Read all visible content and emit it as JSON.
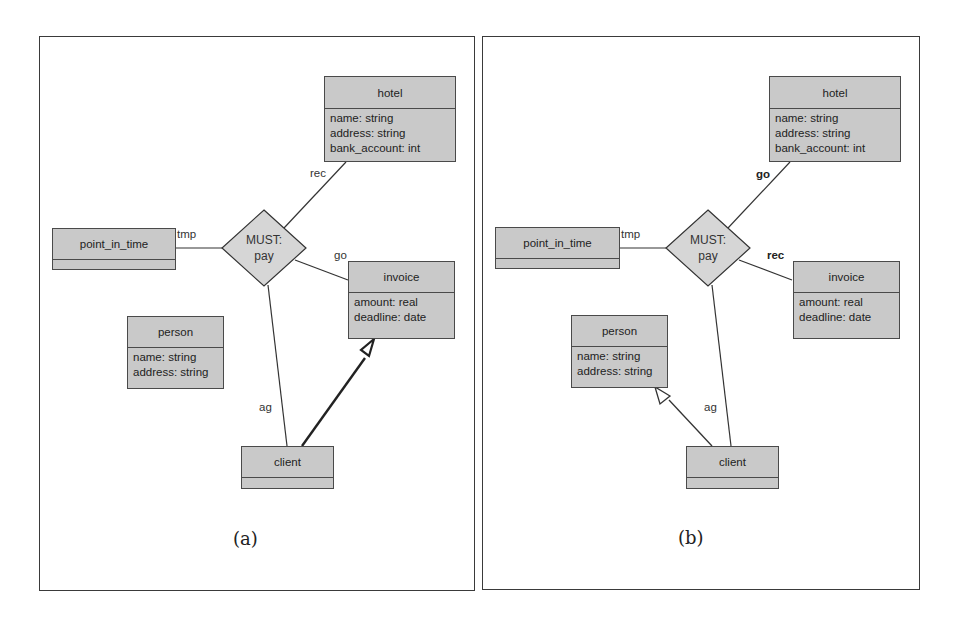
{
  "panels": [
    {
      "id": "a",
      "caption": "(a)",
      "relationship": {
        "line1": "MUST:",
        "line2": "pay"
      },
      "classes": {
        "hotel": {
          "name": "hotel",
          "attrs": [
            "name: string",
            "address: string",
            "bank_account: int"
          ]
        },
        "point_in_time": {
          "name": "point_in_time",
          "attrs": []
        },
        "invoice": {
          "name": "invoice",
          "attrs": [
            "amount: real",
            "deadline: date"
          ]
        },
        "person": {
          "name": "person",
          "attrs": [
            "name: string",
            "address: string"
          ]
        },
        "client": {
          "name": "client",
          "attrs": []
        }
      },
      "roles": {
        "hotel": "rec",
        "point_in_time": "tmp",
        "invoice": "go",
        "client": "ag"
      },
      "generalization": {
        "from": "client",
        "to": "invoice",
        "style": "thick"
      }
    },
    {
      "id": "b",
      "caption": "(b)",
      "relationship": {
        "line1": "MUST:",
        "line2": "pay"
      },
      "classes": {
        "hotel": {
          "name": "hotel",
          "attrs": [
            "name: string",
            "address: string",
            "bank_account: int"
          ]
        },
        "point_in_time": {
          "name": "point_in_time",
          "attrs": []
        },
        "invoice": {
          "name": "invoice",
          "attrs": [
            "amount: real",
            "deadline: date"
          ]
        },
        "person": {
          "name": "person",
          "attrs": [
            "name: string",
            "address: string"
          ]
        },
        "client": {
          "name": "client",
          "attrs": []
        }
      },
      "roles": {
        "hotel": "go",
        "point_in_time": "tmp",
        "invoice": "rec",
        "client": "ag"
      },
      "generalization": {
        "from": "client",
        "to": "person",
        "style": "normal"
      }
    }
  ],
  "colors": {
    "class_fill": "#c9c9c9",
    "diamond_fill": "#d6d6d6",
    "stroke": "#3a3a3a"
  }
}
